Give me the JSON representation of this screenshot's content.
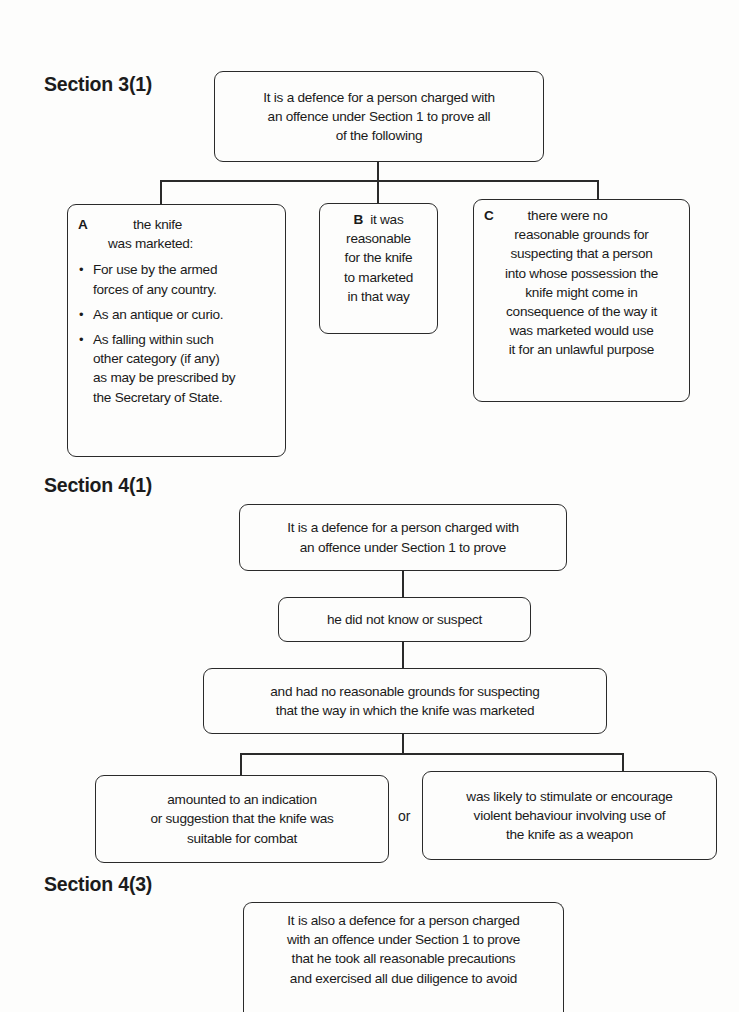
{
  "section_3_1": {
    "heading": "Section 3(1)",
    "root": [
      "It is a defence for a person charged with",
      "an offence under Section 1 to prove all",
      "of the following"
    ],
    "box_a": {
      "tag": "A",
      "head": [
        "the knife",
        "was marketed:"
      ],
      "bullets": [
        [
          "For use by the armed",
          "forces of any country."
        ],
        [
          "As an antique or curio."
        ],
        [
          "As falling within such",
          "other category (if any)",
          "as may be prescribed by",
          "the Secretary of State."
        ]
      ]
    },
    "box_b": {
      "tag": "B",
      "first": "it was",
      "lines": [
        "reasonable",
        "for the knife",
        "to marketed",
        "in that way"
      ]
    },
    "box_c": {
      "tag": "C",
      "first": "there were no",
      "lines": [
        "reasonable grounds for",
        "suspecting that a person",
        "into whose possession the",
        "knife might come in",
        "consequence of the way it",
        "was marketed would use",
        "it for an unlawful purpose"
      ]
    }
  },
  "section_4_1": {
    "heading": "Section 4(1)",
    "root": [
      "It is a defence for a person charged with",
      "an offence under Section 1 to prove"
    ],
    "step2": [
      "he did not know or suspect"
    ],
    "step3": [
      "and had no reasonable grounds for suspecting",
      "that the way in which the knife was marketed"
    ],
    "left": [
      "amounted to an indication",
      "or suggestion that the knife was",
      "suitable for combat"
    ],
    "or": "or",
    "right": [
      "was likely to stimulate or encourage",
      "violent behaviour involving use of",
      "the knife as a weapon"
    ]
  },
  "section_4_3": {
    "heading": "Section 4(3)",
    "box": [
      "It is also a defence for a person charged",
      "with an offence under Section 1 to prove",
      "that he took all reasonable precautions",
      "and exercised all due diligence to avoid"
    ]
  }
}
